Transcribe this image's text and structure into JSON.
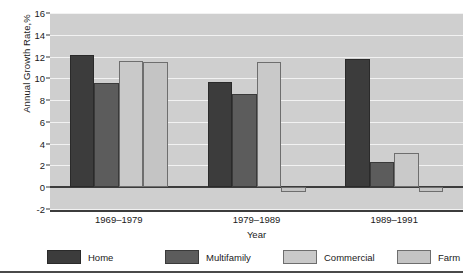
{
  "chart_data": {
    "type": "bar",
    "title": "",
    "xlabel": "Year",
    "ylabel": "Annual Growth Rate,%",
    "categories": [
      "1969–1979",
      "1979–1989",
      "1989–1991"
    ],
    "series": [
      {
        "name": "Home",
        "values": [
          12.1,
          9.7,
          11.8
        ],
        "color": "#3c3c3c"
      },
      {
        "name": "Multifamily",
        "values": [
          9.6,
          8.6,
          2.3
        ],
        "color": "#5c5c5c"
      },
      {
        "name": "Commercial",
        "values": [
          11.6,
          11.5,
          3.1
        ],
        "color": "#c9c9c9"
      },
      {
        "name": "Farm",
        "values": [
          11.5,
          -0.4,
          -0.4
        ],
        "color": "#c4c4c4"
      }
    ],
    "ylim": [
      -2,
      16
    ],
    "yticks": [
      16,
      14,
      12,
      10,
      8,
      6,
      4,
      2,
      0,
      -2
    ],
    "ytick_labels": [
      "16",
      "14",
      "12",
      "10",
      "8",
      "6",
      "4",
      "2",
      "0",
      "-2"
    ],
    "grid": true,
    "grid_axis": "y",
    "legend_position": "bottom",
    "plot_background": "#cfcfcf",
    "gridline_color": "#f2f2f2",
    "axis_color": "#3c3c3c"
  },
  "legend": {
    "items": [
      {
        "label": "Home"
      },
      {
        "label": "Multifamily"
      },
      {
        "label": "Commercial"
      },
      {
        "label": "Farm"
      }
    ]
  }
}
